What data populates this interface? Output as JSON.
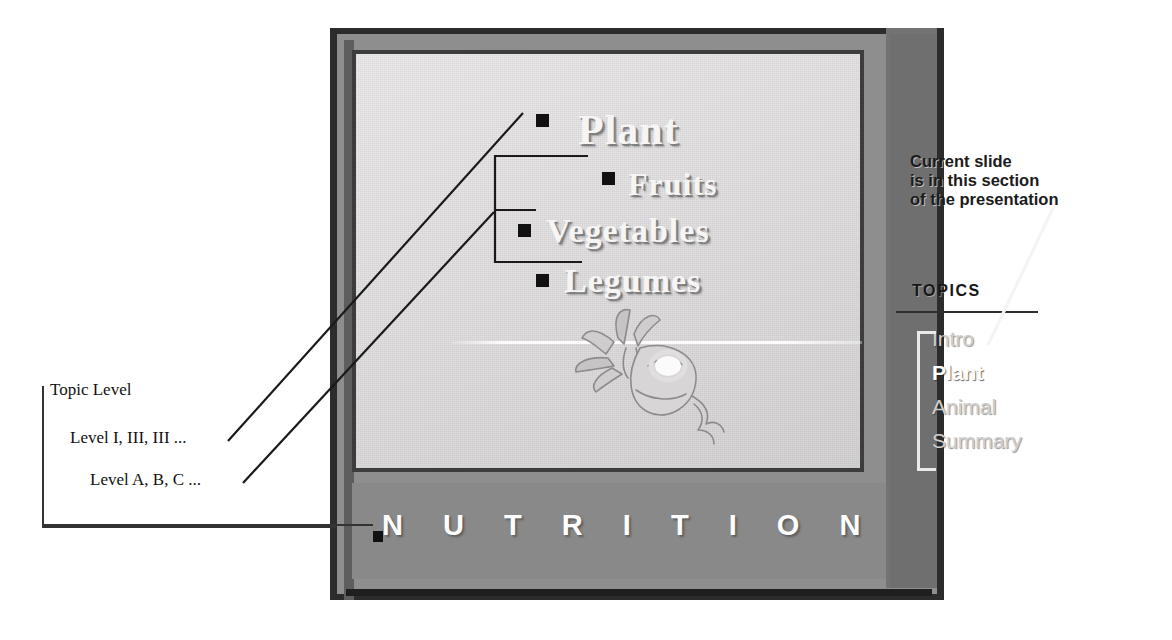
{
  "figure": {
    "kind": "annotated-presentation-slide"
  },
  "slide": {
    "headings": [
      {
        "text": "Plant",
        "level": "topic"
      },
      {
        "text": "Fruits",
        "level": "sub"
      },
      {
        "text": "Vegetables",
        "level": "sub"
      },
      {
        "text": "Legumes",
        "level": "sub"
      }
    ],
    "footer_title": "N U T R I T I O N",
    "artwork_name": "radish-illustration"
  },
  "topics_panel": {
    "callout": "Current slide is in this section of the presentation",
    "callout_lines": [
      "Current slide",
      "is in this section",
      "of the presentation"
    ],
    "heading": "TOPICS",
    "items": [
      {
        "label": "Intro",
        "current": false
      },
      {
        "label": "Plant",
        "current": true
      },
      {
        "label": "Animal",
        "current": false
      },
      {
        "label": "Summary",
        "current": false
      }
    ]
  },
  "annotations": [
    {
      "id": "topic-level",
      "text": "Topic Level"
    },
    {
      "id": "level-roman",
      "text": "Level I, III, III ..."
    },
    {
      "id": "level-alpha",
      "text": "Level A, B, C ..."
    }
  ],
  "colors": {
    "slide_border": "#2c2c2c",
    "slide_mat": "#8e8e8e",
    "topics_panel": "#6f6f6f",
    "canvas": "#e6e4e4",
    "nutrition_band": "#898989",
    "marker": "#111111",
    "current_topic": "#ffffff",
    "topic": "#cfcfcf",
    "annotation_text": "#111111"
  }
}
